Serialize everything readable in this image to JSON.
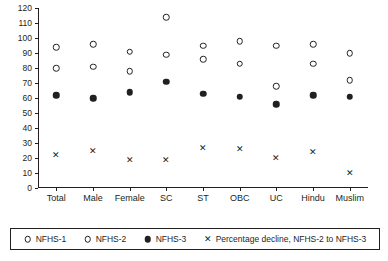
{
  "chart_data": {
    "type": "scatter",
    "title": "",
    "xlabel": "",
    "ylabel": "",
    "ylim": [
      0,
      120
    ],
    "yticks": [
      0,
      10,
      20,
      30,
      40,
      50,
      60,
      70,
      80,
      90,
      100,
      110,
      120
    ],
    "grid": false,
    "legend_position": "bottom",
    "categories": [
      "Total",
      "Male",
      "Female",
      "SC",
      "ST",
      "OBC",
      "UC",
      "Hindu",
      "Muslim"
    ],
    "series": [
      {
        "name": "NFHS-1",
        "marker": "open-circle",
        "values": [
          94,
          96,
          91,
          114,
          95,
          98,
          95,
          96,
          90
        ]
      },
      {
        "name": "NFHS-2",
        "marker": "open-circle",
        "values": [
          80,
          81,
          78,
          89,
          86,
          83,
          68,
          83,
          72
        ]
      },
      {
        "name": "NFHS-3",
        "marker": "filled-circle",
        "values": [
          62,
          60,
          64,
          71,
          63,
          61,
          56,
          62,
          61
        ]
      },
      {
        "name": "Percentage decline, NFHS-2 to NFHS-3",
        "marker": "cross",
        "values": [
          22,
          25,
          19,
          19,
          27,
          26,
          20,
          24,
          10
        ]
      }
    ],
    "legend_entries": [
      "NFHS-1",
      "NFHS-2",
      "NFHS-3",
      "Percentage decline, NFHS-2 to NFHS-3"
    ]
  }
}
